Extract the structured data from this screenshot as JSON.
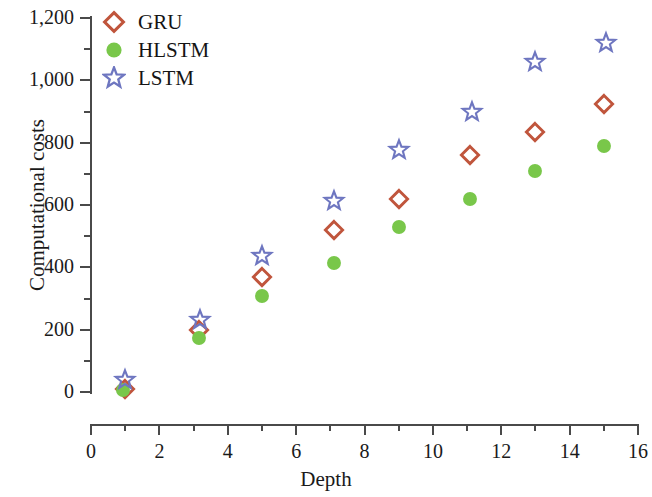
{
  "chart_data": {
    "type": "scatter",
    "title": "",
    "xlabel": "Depth",
    "ylabel": "Computational costs",
    "xlim": [
      0,
      16
    ],
    "ylim": [
      0,
      1200
    ],
    "x_ticks": [
      "0",
      "2",
      "4",
      "6",
      "8",
      "10",
      "12",
      "14",
      "16"
    ],
    "x_tick_values": [
      0,
      2,
      4,
      6,
      8,
      10,
      12,
      14,
      16
    ],
    "x_minor_tick_values": [
      1,
      3,
      5,
      7,
      9,
      11,
      13,
      15
    ],
    "y_ticks": [
      "0",
      "200",
      "400",
      "600",
      "800",
      "1,000",
      "1,200"
    ],
    "y_tick_values": [
      0,
      200,
      400,
      600,
      800,
      1000,
      1200
    ],
    "y_minor_tick_values": [
      100,
      300,
      500,
      700,
      900,
      1100
    ],
    "grid": false,
    "legend_position": "top-left",
    "series": [
      {
        "name": "GRU",
        "marker": "open-diamond",
        "color": "#c0553c",
        "x": [
          1,
          3.15,
          5,
          7.1,
          9,
          11.1,
          13,
          15
        ],
        "values": [
          10,
          200,
          368,
          520,
          618,
          760,
          833,
          925
        ]
      },
      {
        "name": "HLSTM",
        "marker": "filled-circle",
        "color": "#79c74a",
        "x": [
          0.95,
          3.15,
          5,
          7.1,
          9,
          11.1,
          13,
          15
        ],
        "values": [
          8,
          172,
          308,
          415,
          528,
          620,
          710,
          790
        ]
      },
      {
        "name": "LSTM",
        "marker": "open-star",
        "color": "#6e76c0",
        "x": [
          1,
          3.2,
          5,
          7.1,
          9,
          11.15,
          13,
          15.05
        ],
        "values": [
          40,
          231,
          435,
          612,
          775,
          898,
          1058,
          1120
        ]
      }
    ]
  },
  "legend": {
    "items": [
      {
        "label": "GRU",
        "marker": "open-diamond",
        "color": "#c0553c"
      },
      {
        "label": "HLSTM",
        "marker": "filled-circle",
        "color": "#79c74a"
      },
      {
        "label": "LSTM",
        "marker": "open-star",
        "color": "#6e76c0"
      }
    ]
  },
  "axes": {
    "x_title": "Depth",
    "y_title": "Computational costs"
  }
}
